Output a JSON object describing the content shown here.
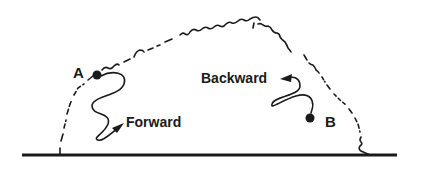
{
  "diagram": {
    "points": [
      {
        "id": "A",
        "label": "A"
      },
      {
        "id": "B",
        "label": "B"
      }
    ],
    "directions": {
      "forward": "Forward",
      "backward": "Backward"
    },
    "colors": {
      "ink": "#1a1a1a",
      "background": "#ffffff"
    }
  }
}
